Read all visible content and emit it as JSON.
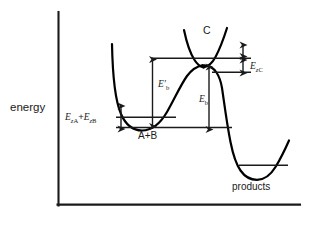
{
  "diagram": {
    "kind": "potential-energy-reaction-coordinate-diagram",
    "axes": {
      "y_label": "energy",
      "x_label": "",
      "y_axis": {
        "x": 58,
        "y_top": 12,
        "y_bottom": 205
      },
      "x_axis": {
        "y": 205,
        "x_left": 58,
        "x_right": 300
      }
    },
    "labels": {
      "energy": "energy",
      "complex_c": "C",
      "reactants": "A+B",
      "products": "products",
      "zero_point_reactants": {
        "symbol": "E",
        "sub1": "z",
        "sub2": "A",
        "plus": "+",
        "symbol2": "E",
        "sub3": "z",
        "sub4": "B",
        "text": "EzA + EzB"
      },
      "zero_point_complex": {
        "symbol": "E",
        "sub1": "z",
        "sub2": "C",
        "text": "EzC"
      },
      "barrier_classical": {
        "symbol": "E",
        "prime": "′",
        "sub": "b",
        "text": "E′b"
      },
      "barrier_effective": {
        "symbol": "E",
        "sub": "b",
        "text": "Eb"
      }
    },
    "energy_levels": [
      {
        "name": "reactant-well-minimum",
        "y": 127,
        "x1": 116,
        "x2": 232
      },
      {
        "name": "reactant-zero-point-level",
        "y": 117,
        "x1": 116,
        "x2": 175
      },
      {
        "name": "complex-c-zero-point-level",
        "y": 58,
        "x1": 152,
        "x2": 251
      },
      {
        "name": "complex-c-well-minimum",
        "y": 72,
        "x1": 214,
        "x2": 251
      },
      {
        "name": "product-zero-point-level",
        "y": 165,
        "x1": 239,
        "x2": 287
      }
    ],
    "measurement_arrows": [
      {
        "name": "ez-ab-arrow",
        "x": 121,
        "y1": 105,
        "y2": 130,
        "style": "double-headed"
      },
      {
        "name": "ez-c-arrow-upper",
        "x": 243,
        "y1": 44,
        "y2": 57,
        "style": "double-headed"
      },
      {
        "name": "ez-c-arrow-lower",
        "x": 243,
        "y1": 59,
        "y2": 73,
        "style": "double-headed"
      },
      {
        "name": "eb-prime-arrow",
        "x": 152,
        "y1": 58,
        "y2": 127,
        "style": "double-headed"
      },
      {
        "name": "eb-arrow",
        "x": 209,
        "y1": 66,
        "y2": 130,
        "style": "double-headed"
      }
    ],
    "colors": {
      "curve": "#000000",
      "axis": "#1a1a1a",
      "level_line": "#1a1a1a",
      "background": "#ffffff",
      "text": "#1a1a1a"
    },
    "curves": [
      {
        "name": "reactant-potential-well",
        "description": "steep left wall descending to minimum then rising to transition-state barrier"
      },
      {
        "name": "barrier-peak",
        "description": "inverted parabola peak of activation barrier"
      },
      {
        "name": "complex-c-potential-well",
        "description": "upward parabola of intermediate complex C crossing the barrier peak"
      },
      {
        "name": "product-potential-well",
        "description": "descent to deep product well then rise at right"
      }
    ]
  }
}
